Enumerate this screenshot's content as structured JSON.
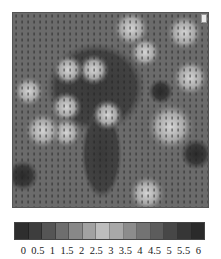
{
  "figure": {
    "title": ""
  },
  "colorbar": {
    "tick_labels": [
      "0",
      "0.5",
      "1",
      "1.5",
      "2",
      "2.5",
      "3",
      "3.5",
      "4",
      "4.5",
      "5",
      "5.5",
      "6"
    ],
    "cell_colors": [
      "#2e2e2e",
      "#3d3d3d",
      "#555555",
      "#6e6e6e",
      "#888888",
      "#a2a2a2",
      "#bdbdbd",
      "#a8a8a8",
      "#8c8c8c",
      "#737373",
      "#5c5c5c",
      "#474747",
      "#363636",
      "#2a2a2a"
    ]
  },
  "chart_data": {
    "type": "heatmap",
    "title": "",
    "xlabel": "",
    "ylabel": "",
    "colorbar": {
      "levels": [
        0,
        0.5,
        1,
        1.5,
        2,
        2.5,
        3,
        3.5,
        4,
        4.5,
        5,
        5.5,
        6
      ],
      "tick_labels": [
        "0",
        "0.5",
        "1",
        "1.5",
        "2",
        "2.5",
        "3",
        "3.5",
        "4",
        "4.5",
        "5",
        "5.5",
        "6"
      ],
      "orientation": "horizontal",
      "position": "bottom"
    },
    "grid": true,
    "overlay": "regular grid of small vector/arrow markers",
    "background_level": 4.5,
    "features": [
      {
        "kind": "dark-region",
        "cx": 0.42,
        "cy": 0.38,
        "rx": 0.22,
        "ry": 0.2,
        "level": 5.5
      },
      {
        "kind": "dark-channel",
        "cx": 0.45,
        "cy": 0.72,
        "rx": 0.09,
        "ry": 0.2,
        "level": 5.5
      },
      {
        "kind": "bright-spot",
        "cx": 0.28,
        "cy": 0.29,
        "r": 0.05,
        "level": 3
      },
      {
        "kind": "bright-spot",
        "cx": 0.41,
        "cy": 0.29,
        "r": 0.05,
        "level": 3
      },
      {
        "kind": "bright-spot",
        "cx": 0.27,
        "cy": 0.48,
        "r": 0.05,
        "level": 3
      },
      {
        "kind": "bright-spot",
        "cx": 0.27,
        "cy": 0.61,
        "r": 0.05,
        "level": 3
      },
      {
        "kind": "bright-spot",
        "cx": 0.6,
        "cy": 0.08,
        "r": 0.06,
        "level": 3
      },
      {
        "kind": "bright-spot",
        "cx": 0.87,
        "cy": 0.1,
        "r": 0.06,
        "level": 3
      },
      {
        "kind": "bright-spot",
        "cx": 0.67,
        "cy": 0.2,
        "r": 0.05,
        "level": 3
      },
      {
        "kind": "bright-spot",
        "cx": 0.9,
        "cy": 0.33,
        "r": 0.06,
        "level": 2.5
      },
      {
        "kind": "bright-spot",
        "cx": 0.8,
        "cy": 0.58,
        "r": 0.08,
        "level": 2.5
      },
      {
        "kind": "bright-spot",
        "cx": 0.08,
        "cy": 0.4,
        "r": 0.05,
        "level": 3
      },
      {
        "kind": "bright-spot",
        "cx": 0.15,
        "cy": 0.6,
        "r": 0.06,
        "level": 3
      },
      {
        "kind": "bright-spot",
        "cx": 0.68,
        "cy": 0.92,
        "r": 0.06,
        "level": 2.5
      },
      {
        "kind": "bright-spot",
        "cx": 0.48,
        "cy": 0.52,
        "r": 0.05,
        "level": 3
      },
      {
        "kind": "dark-spot",
        "cx": 0.75,
        "cy": 0.4,
        "r": 0.04,
        "level": 5.5
      },
      {
        "kind": "dark-spot",
        "cx": 0.93,
        "cy": 0.72,
        "r": 0.05,
        "level": 5.5
      },
      {
        "kind": "dark-spot",
        "cx": 0.05,
        "cy": 0.83,
        "r": 0.05,
        "level": 5.5
      }
    ]
  }
}
